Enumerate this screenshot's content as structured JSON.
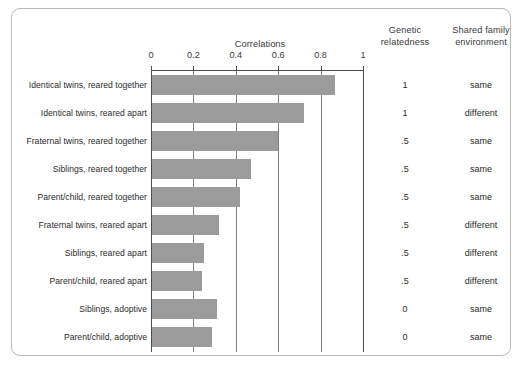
{
  "figure": {
    "bar_color": "#9b9b9b",
    "frame_color": "#b9b9b9",
    "axis_color": "#4d4d4d",
    "grid_color": "#7f7f7f"
  },
  "headers": {
    "axis_title": "Correlations",
    "genetic_line1": "Genetic",
    "genetic_line2": "relatedness",
    "shared_line1": "Shared family",
    "shared_line2": "environment"
  },
  "axis": {
    "ticks": [
      "0",
      "0.2",
      "0.4",
      "0.6",
      "0.8",
      "1"
    ]
  },
  "chart_data": {
    "type": "bar",
    "orientation": "horizontal",
    "title": "Correlations",
    "xlabel": "Correlations",
    "ylabel": "",
    "xlim": [
      0,
      1
    ],
    "xticks": [
      0,
      0.2,
      0.4,
      0.6,
      0.8,
      1
    ],
    "grid": true,
    "legend": "none",
    "categories": [
      "Identical twins, reared together",
      "Identical twins, reared apart",
      "Fraternal twins, reared together",
      "Siblings, reared together",
      "Parent/child, reared together",
      "Fraternal twins, reared apart",
      "Siblings, reared apart",
      "Parent/child, reared apart",
      "Siblings, adoptive",
      "Parent/child, adoptive"
    ],
    "values": [
      0.87,
      0.72,
      0.6,
      0.47,
      0.42,
      0.32,
      0.25,
      0.24,
      0.31,
      0.29
    ],
    "annotations": {
      "genetic_relatedness": [
        "1",
        "1",
        ".5",
        ".5",
        ".5",
        ".5",
        ".5",
        ".5",
        "0",
        "0"
      ],
      "shared_family_environment": [
        "same",
        "different",
        "same",
        "same",
        "same",
        "different",
        "different",
        "different",
        "same",
        "same"
      ]
    }
  },
  "rows": [
    {
      "label": "Identical twins, reared together",
      "value": 0.87,
      "genetic": "1",
      "shared": "same"
    },
    {
      "label": "Identical twins, reared apart",
      "value": 0.72,
      "genetic": "1",
      "shared": "different"
    },
    {
      "label": "Fraternal twins, reared together",
      "value": 0.6,
      "genetic": ".5",
      "shared": "same"
    },
    {
      "label": "Siblings, reared together",
      "value": 0.47,
      "genetic": ".5",
      "shared": "same"
    },
    {
      "label": "Parent/child, reared together",
      "value": 0.42,
      "genetic": ".5",
      "shared": "same"
    },
    {
      "label": "Fraternal twins, reared apart",
      "value": 0.32,
      "genetic": ".5",
      "shared": "different"
    },
    {
      "label": "Siblings, reared apart",
      "value": 0.25,
      "genetic": ".5",
      "shared": "different"
    },
    {
      "label": "Parent/child, reared apart",
      "value": 0.24,
      "genetic": ".5",
      "shared": "different"
    },
    {
      "label": "Siblings, adoptive",
      "value": 0.31,
      "genetic": "0",
      "shared": "same"
    },
    {
      "label": "Parent/child, adoptive",
      "value": 0.29,
      "genetic": "0",
      "shared": "same"
    }
  ]
}
